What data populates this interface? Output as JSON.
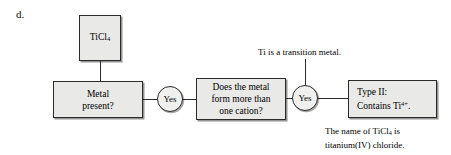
{
  "item": {
    "letter": "d."
  },
  "flowchart": {
    "formula_box": {
      "label": "TiCl4",
      "formula_base": "TiCl",
      "formula_sub": "4"
    },
    "decisions": [
      {
        "label": "Metal\npresent?"
      },
      {
        "label": "Does the metal\nform more than\none cation?"
      }
    ],
    "answers": [
      {
        "label": "Yes"
      },
      {
        "label": "Yes"
      }
    ],
    "result_box": {
      "line1": "Type II:",
      "line2_prefix": "Contains Ti",
      "line2_sup": "4+",
      "line2_suffix": "."
    }
  },
  "annotations": {
    "transition_metal": "Ti is a transition metal.",
    "name_line1_prefix": "The name of TiCl",
    "name_line1_sub": "4",
    "name_line1_suffix": " is",
    "name_line2": "titanium(IV) chloride."
  },
  "colors": {
    "box_fill": "#e9e9e7",
    "border": "#2b2b2b",
    "text": "#000000",
    "background": "#ffffff"
  }
}
